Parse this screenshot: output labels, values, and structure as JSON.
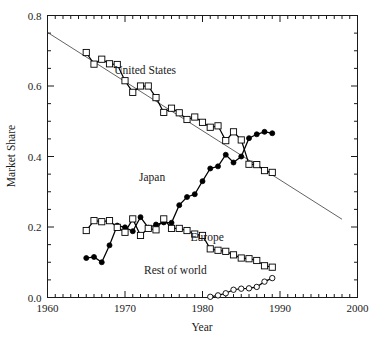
{
  "chart_data": {
    "type": "line",
    "title": "",
    "xlabel": "Year",
    "ylabel": "Market Share",
    "xlim": [
      1960,
      2000
    ],
    "ylim": [
      0.0,
      0.8
    ],
    "xticks": [
      1960,
      1970,
      1980,
      1990,
      2000
    ],
    "xtick_labels": [
      "1960",
      "1970",
      "1980",
      "1990",
      "2000"
    ],
    "yticks": [
      0.0,
      0.2,
      0.4,
      0.6,
      0.8
    ],
    "ytick_labels": [
      "0.0",
      "0.2",
      "0.4",
      "0.6",
      "0.8"
    ],
    "minor_xtick_interval": 1,
    "minor_ytick_interval": 0.05,
    "grid": false,
    "legend": "inline-annotations",
    "series": [
      {
        "name": "United States",
        "marker": "open-square",
        "label_x": 1972.6,
        "label_y": 0.635,
        "x": [
          1965,
          1966,
          1967,
          1968,
          1969,
          1970,
          1971,
          1972,
          1973,
          1974,
          1975,
          1976,
          1977,
          1978,
          1979,
          1980,
          1981,
          1982,
          1983,
          1984,
          1985,
          1986,
          1987,
          1988,
          1989
        ],
        "values": [
          0.695,
          0.662,
          0.676,
          0.663,
          0.661,
          0.615,
          0.582,
          0.6,
          0.6,
          0.567,
          0.525,
          0.537,
          0.524,
          0.505,
          0.512,
          0.497,
          0.483,
          0.487,
          0.445,
          0.47,
          0.447,
          0.378,
          0.377,
          0.36,
          0.355
        ]
      },
      {
        "name": "Japan",
        "marker": "filled-circle",
        "label_x": 1973.5,
        "label_y": 0.33,
        "x": [
          1965,
          1966,
          1967,
          1968,
          1969,
          1970,
          1971,
          1972,
          1973,
          1974,
          1975,
          1976,
          1977,
          1978,
          1979,
          1980,
          1981,
          1982,
          1983,
          1984,
          1985,
          1986,
          1987,
          1988,
          1989
        ],
        "values": [
          0.112,
          0.115,
          0.1,
          0.148,
          0.204,
          0.199,
          0.188,
          0.228,
          0.198,
          0.207,
          0.213,
          0.212,
          0.262,
          0.285,
          0.293,
          0.33,
          0.366,
          0.372,
          0.405,
          0.383,
          0.4,
          0.452,
          0.463,
          0.47,
          0.466
        ]
      },
      {
        "name": "Europe",
        "marker": "open-square",
        "label_x": 1980.6,
        "label_y": 0.16,
        "x": [
          1965,
          1966,
          1967,
          1968,
          1969,
          1970,
          1971,
          1972,
          1973,
          1974,
          1975,
          1976,
          1977,
          1978,
          1979,
          1980,
          1981,
          1982,
          1983,
          1984,
          1985,
          1986,
          1987,
          1988,
          1989
        ],
        "values": [
          0.19,
          0.218,
          0.215,
          0.218,
          0.199,
          0.185,
          0.223,
          0.176,
          0.196,
          0.192,
          0.223,
          0.196,
          0.196,
          0.19,
          0.18,
          0.176,
          0.138,
          0.134,
          0.131,
          0.121,
          0.112,
          0.11,
          0.105,
          0.09,
          0.086
        ]
      },
      {
        "name": "Rest of world",
        "marker": "open-circle",
        "label_x": 1976.5,
        "label_y": 0.066,
        "x": [
          1981,
          1982,
          1983,
          1984,
          1985,
          1986,
          1987,
          1988,
          1989
        ],
        "values": [
          0.002,
          0.006,
          0.012,
          0.022,
          0.025,
          0.026,
          0.03,
          0.045,
          0.055
        ]
      }
    ],
    "annotations": [
      {
        "name": "us-trend-line",
        "type": "linear-fit",
        "x": [
          1960,
          1998
        ],
        "values": [
          0.752,
          0.222
        ]
      }
    ]
  },
  "labels": {
    "united_states": "United States",
    "japan": "Japan",
    "europe": "Europe",
    "rest_of_world": "Rest of world",
    "x_axis_title": "Year",
    "y_axis_title": "Market Share"
  }
}
